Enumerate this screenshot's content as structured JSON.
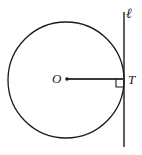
{
  "figure": {
    "type": "geometry-diagram",
    "canvas": {
      "width": 142,
      "height": 155,
      "background": "#ffffff"
    },
    "stroke_color": "#1a1a1a",
    "labels": {
      "line_label": "ℓ",
      "center_label": "O",
      "tangent_point_label": "T"
    },
    "elements": {
      "circle": {
        "name": "circle",
        "center_x": 66,
        "center_y": 80,
        "radius": 58,
        "stroke_width": 1.3,
        "fill": "none"
      },
      "tangent_line": {
        "name": "tangent-line",
        "x": 124,
        "y_top": 12,
        "y_bottom": 147,
        "stroke_width": 1.4
      },
      "radius_segment": {
        "name": "radius-segment",
        "x1": 67,
        "y1": 79,
        "x2": 124,
        "y2": 79,
        "stroke_width": 1.8
      },
      "center_dot": {
        "name": "center-dot",
        "cx": 67,
        "cy": 79,
        "r": 1.8
      },
      "right_angle_marker": {
        "name": "right-angle-marker",
        "corner_x": 124,
        "corner_y": 79,
        "size": 8,
        "stroke_width": 1.1
      }
    }
  }
}
